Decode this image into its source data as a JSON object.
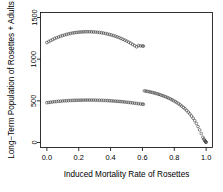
{
  "chart_data": {
    "type": "scatter",
    "title": "",
    "xlabel": "Induced Mortality Rate of Rosettes",
    "ylabel": "Long−Term Population of Rosettes + Adults",
    "xlim": [
      -0.04,
      1.04
    ],
    "ylim": [
      -60,
      1560
    ],
    "xticks": [
      0.0,
      0.2,
      0.4,
      0.6,
      0.8,
      1.0
    ],
    "xticklabels": [
      "0.0",
      "0.2",
      "0.4",
      "0.6",
      "0.8",
      "1.0"
    ],
    "yticks": [
      0,
      500,
      1000,
      1500
    ],
    "yticklabels": [
      "0",
      "500",
      "1000",
      "1500"
    ],
    "grid": false,
    "legend": false,
    "marker": "open-circle",
    "marker_color": "#3a3a3a",
    "series": [
      {
        "name": "upper-branch",
        "x": [
          0.0,
          0.0122,
          0.0245,
          0.0367,
          0.049,
          0.0612,
          0.0735,
          0.0857,
          0.098,
          0.1102,
          0.1224,
          0.1347,
          0.1469,
          0.1592,
          0.1714,
          0.1837,
          0.1959,
          0.2082,
          0.2204,
          0.2327,
          0.2449,
          0.2571,
          0.2694,
          0.2816,
          0.2939,
          0.3061,
          0.3184,
          0.3306,
          0.3429,
          0.3551,
          0.3673,
          0.3796,
          0.3918,
          0.4041,
          0.4163,
          0.4286,
          0.4408,
          0.4531,
          0.4653,
          0.4776,
          0.4898,
          0.502,
          0.5143,
          0.5265,
          0.5388,
          0.551,
          0.5633,
          0.5755,
          0.5878,
          0.6,
          0.6061
        ],
        "y": [
          1199,
          1212,
          1224,
          1236,
          1247,
          1257,
          1266,
          1275,
          1283,
          1290,
          1297,
          1303,
          1308,
          1313,
          1317,
          1320,
          1323,
          1325,
          1327,
          1328,
          1329,
          1329,
          1329,
          1328,
          1327,
          1325,
          1323,
          1320,
          1317,
          1313,
          1308,
          1303,
          1297,
          1291,
          1284,
          1276,
          1268,
          1259,
          1249,
          1239,
          1228,
          1216,
          1204,
          1191,
          1177,
          1163,
          1148,
          1163,
          1160,
          1158,
          1157
        ]
      },
      {
        "name": "lower-branch-left",
        "x": [
          0.0,
          0.0122,
          0.0245,
          0.0367,
          0.049,
          0.0612,
          0.0735,
          0.0857,
          0.098,
          0.1102,
          0.1224,
          0.1347,
          0.1469,
          0.1592,
          0.1714,
          0.1837,
          0.1959,
          0.2082,
          0.2204,
          0.2327,
          0.2449,
          0.2571,
          0.2694,
          0.2816,
          0.2939,
          0.3061,
          0.3184,
          0.3306,
          0.3429,
          0.3551,
          0.3673,
          0.3796,
          0.3918,
          0.4041,
          0.4163,
          0.4286,
          0.4408,
          0.4531,
          0.4653,
          0.4776,
          0.4898,
          0.502,
          0.5143,
          0.5265,
          0.5388,
          0.551,
          0.5633,
          0.5755,
          0.5878,
          0.6,
          0.6061
        ],
        "y": [
          478,
          481,
          484,
          487,
          490,
          492,
          494,
          496,
          498,
          500,
          501,
          503,
          504,
          505,
          506,
          507,
          507,
          508,
          508,
          509,
          509,
          509,
          509,
          509,
          508,
          508,
          507,
          507,
          506,
          505,
          504,
          503,
          501,
          500,
          498,
          496,
          495,
          493,
          491,
          488,
          486,
          483,
          481,
          478,
          475,
          472,
          469,
          466,
          463,
          460,
          458
        ]
      },
      {
        "name": "descending-branch",
        "x": [
          0.6122,
          0.6224,
          0.6327,
          0.6429,
          0.6531,
          0.6633,
          0.6735,
          0.6837,
          0.6939,
          0.7041,
          0.7143,
          0.7245,
          0.7347,
          0.7449,
          0.7551,
          0.7653,
          0.7755,
          0.7857,
          0.7959,
          0.8061,
          0.8163,
          0.8265,
          0.8367,
          0.8469,
          0.8571,
          0.8673,
          0.8776,
          0.8878,
          0.898,
          0.9082,
          0.9184,
          0.9286,
          0.9388,
          0.949,
          0.9592,
          0.9694,
          0.9796,
          0.9857,
          0.9898,
          0.9939,
          0.9969,
          0.9986,
          1.0
        ],
        "y": [
          620,
          617,
          613,
          609,
          605,
          600,
          595,
          590,
          584,
          578,
          571,
          564,
          557,
          549,
          541,
          532,
          523,
          513,
          502,
          491,
          479,
          466,
          452,
          437,
          421,
          404,
          385,
          365,
          343,
          318,
          291,
          261,
          228,
          191,
          151,
          108,
          63,
          41,
          27,
          16,
          9,
          5,
          2
        ]
      }
    ]
  }
}
